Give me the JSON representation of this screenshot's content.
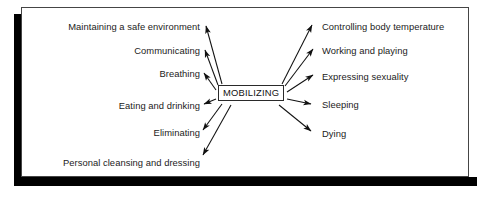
{
  "diagram": {
    "type": "radial-concept-map",
    "center": {
      "label": "MOBILIZING",
      "box_border_color": "#2a2a2a"
    },
    "frame": {
      "border_color": "#454545",
      "shadow_color": "#000000",
      "background": "#ffffff"
    },
    "nodes": [
      {
        "id": "maintaining-a-safe-environment",
        "label": "Maintaining a safe environment",
        "side": "left",
        "x": 200,
        "y": 27
      },
      {
        "id": "communicating",
        "label": "Communicating",
        "side": "left",
        "x": 200,
        "y": 51
      },
      {
        "id": "breathing",
        "label": "Breathing",
        "side": "left",
        "x": 200,
        "y": 74
      },
      {
        "id": "eating-and-drinking",
        "label": "Eating and drinking",
        "side": "left",
        "x": 200,
        "y": 106
      },
      {
        "id": "eliminating",
        "label": "Eliminating",
        "side": "left",
        "x": 200,
        "y": 133
      },
      {
        "id": "personal-cleansing-and-dressing",
        "label": "Personal cleansing and dressing",
        "side": "left",
        "x": 200,
        "y": 163
      },
      {
        "id": "controlling-body-temperature",
        "label": "Controlling body temperature",
        "side": "right",
        "x": 322,
        "y": 27
      },
      {
        "id": "working-and-playing",
        "label": "Working and playing",
        "side": "right",
        "x": 322,
        "y": 51
      },
      {
        "id": "expressing-sexuality",
        "label": "Expressing sexuality",
        "side": "right",
        "x": 322,
        "y": 77
      },
      {
        "id": "sleeping",
        "label": "Sleeping",
        "side": "right",
        "x": 322,
        "y": 105
      },
      {
        "id": "dying",
        "label": "Dying",
        "side": "right",
        "x": 322,
        "y": 134
      }
    ],
    "arrows": [
      {
        "from": "center",
        "to": "maintaining-a-safe-environment"
      },
      {
        "from": "center",
        "to": "communicating"
      },
      {
        "from": "center",
        "to": "breathing"
      },
      {
        "from": "center",
        "to": "eating-and-drinking"
      },
      {
        "from": "center",
        "to": "eliminating"
      },
      {
        "from": "center",
        "to": "personal-cleansing-and-dressing"
      },
      {
        "from": "center",
        "to": "controlling-body-temperature"
      },
      {
        "from": "center",
        "to": "working-and-playing"
      },
      {
        "from": "center",
        "to": "expressing-sexuality"
      },
      {
        "from": "center",
        "to": "sleeping"
      },
      {
        "from": "center",
        "to": "dying"
      }
    ]
  }
}
